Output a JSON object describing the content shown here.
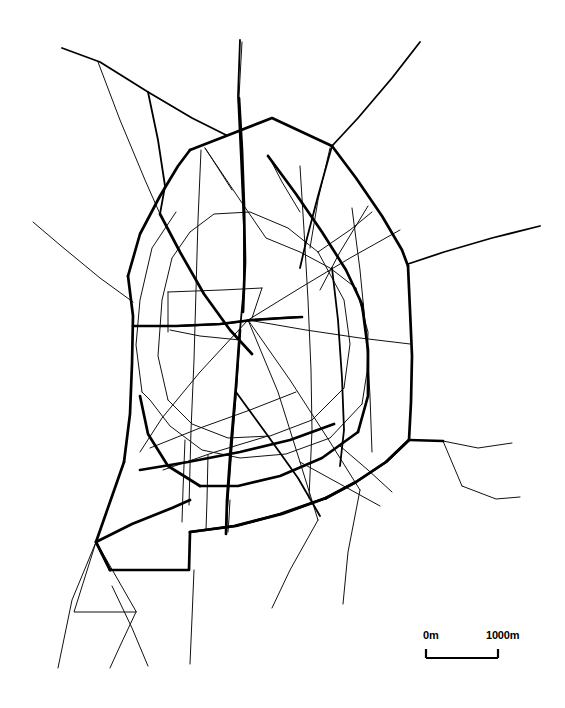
{
  "figure": {
    "kind": "schematic-road-network-map",
    "background_color": "#ffffff",
    "line_color": "#000000",
    "width": 565,
    "height": 708
  },
  "scalebar": {
    "name": "map-scale-bar",
    "left_label": "0m",
    "right_label": "1000m",
    "bar_length_px": 72,
    "represents_meters": 1000,
    "tick_color": "#000000"
  },
  "legend_notes": {
    "thick_lines": "arterial / ring roads",
    "thin_lines": "secondary streets"
  },
  "map_data": {
    "stroke_widths": {
      "arterial": 2.6,
      "major": 1.9,
      "minor": 1.0
    },
    "ring_road": {
      "name": "outer-ring-road",
      "width_class": "arterial",
      "points": [
        [
          222,
          97
        ],
        [
          330,
          145
        ],
        [
          370,
          205
        ],
        [
          405,
          265
        ],
        [
          412,
          345
        ],
        [
          410,
          432
        ],
        [
          408,
          442
        ],
        [
          330,
          497
        ],
        [
          320,
          530
        ],
        [
          188,
          532
        ],
        [
          188,
          569
        ],
        [
          108,
          569
        ],
        [
          95,
          540
        ],
        [
          128,
          470
        ],
        [
          133,
          380
        ],
        [
          127,
          300
        ],
        [
          160,
          213
        ],
        [
          190,
          150
        ]
      ]
    },
    "inner_ring": {
      "name": "inner-ring-road",
      "width_class": "major",
      "points": [
        [
          203,
          146
        ],
        [
          267,
          240
        ],
        [
          302,
          253
        ],
        [
          355,
          285
        ],
        [
          370,
          330
        ],
        [
          366,
          400
        ],
        [
          330,
          440
        ],
        [
          268,
          460
        ],
        [
          205,
          452
        ],
        [
          158,
          406
        ],
        [
          142,
          330
        ],
        [
          150,
          250
        ],
        [
          176,
          212
        ]
      ]
    },
    "radials": [
      {
        "name": "radial-nw",
        "width_class": "major",
        "points": [
          [
            190,
            150
          ],
          [
            100,
            60
          ],
          [
            62,
            47
          ]
        ]
      },
      {
        "name": "radial-n-upper",
        "width_class": "major",
        "points": [
          [
            222,
            97
          ],
          [
            240,
            40
          ]
        ]
      },
      {
        "name": "radial-ne",
        "width_class": "major",
        "points": [
          [
            330,
            145
          ],
          [
            420,
            42
          ]
        ]
      },
      {
        "name": "radial-e",
        "width_class": "major",
        "points": [
          [
            405,
            265
          ],
          [
            540,
            225
          ]
        ]
      },
      {
        "name": "radial-w",
        "width_class": "minor",
        "points": [
          [
            127,
            300
          ],
          [
            35,
            200
          ]
        ]
      },
      {
        "name": "radial-se-a",
        "width_class": "minor",
        "points": [
          [
            440,
            440
          ],
          [
            480,
            448
          ],
          [
            510,
            442
          ]
        ]
      },
      {
        "name": "radial-se-b",
        "width_class": "minor",
        "points": [
          [
            463,
            487
          ],
          [
            500,
            500
          ],
          [
            520,
            498
          ]
        ]
      },
      {
        "name": "radial-s-a",
        "width_class": "minor",
        "points": [
          [
            383,
            486
          ],
          [
            355,
            565
          ],
          [
            345,
            605
          ]
        ]
      },
      {
        "name": "radial-s-b",
        "width_class": "minor",
        "points": [
          [
            290,
            530
          ],
          [
            250,
            600
          ],
          [
            230,
            640
          ]
        ]
      },
      {
        "name": "radial-s-c",
        "width_class": "minor",
        "points": [
          [
            193,
            545
          ],
          [
            192,
            610
          ],
          [
            190,
            665
          ]
        ]
      },
      {
        "name": "radial-sw-a",
        "width_class": "minor",
        "points": [
          [
            108,
            569
          ],
          [
            70,
            640
          ],
          [
            58,
            668
          ]
        ]
      },
      {
        "name": "radial-sw-b",
        "width_class": "minor",
        "points": [
          [
            128,
            570
          ],
          [
            140,
            640
          ],
          [
            147,
            668
          ]
        ]
      },
      {
        "name": "radial-nw-branch",
        "width_class": "minor",
        "points": [
          [
            100,
            60
          ],
          [
            160,
            213
          ]
        ]
      }
    ],
    "cross_streets": [
      {
        "name": "street-center-spine",
        "width_class": "major",
        "points": [
          [
            240,
            40
          ],
          [
            238,
            120
          ],
          [
            243,
            215
          ],
          [
            240,
            300
          ],
          [
            232,
            380
          ],
          [
            228,
            470
          ],
          [
            225,
            540
          ]
        ]
      },
      {
        "name": "street-vertical-west",
        "width_class": "minor",
        "points": [
          [
            200,
            150
          ],
          [
            197,
            240
          ],
          [
            193,
            330
          ],
          [
            190,
            420
          ],
          [
            188,
            520
          ]
        ]
      },
      {
        "name": "street-vertical-east",
        "width_class": "minor",
        "points": [
          [
            300,
            165
          ],
          [
            305,
            250
          ],
          [
            310,
            330
          ],
          [
            312,
            420
          ],
          [
            308,
            500
          ]
        ]
      },
      {
        "name": "street-diagonal-a",
        "width_class": "minor",
        "points": [
          [
            150,
            250
          ],
          [
            230,
            300
          ],
          [
            300,
            340
          ],
          [
            370,
            390
          ]
        ]
      },
      {
        "name": "street-diagonal-b",
        "width_class": "minor",
        "points": [
          [
            140,
            440
          ],
          [
            220,
            400
          ],
          [
            300,
            360
          ],
          [
            380,
            320
          ]
        ]
      },
      {
        "name": "street-horizontal-mid",
        "width_class": "major",
        "points": [
          [
            133,
            325
          ],
          [
            195,
            323
          ],
          [
            260,
            318
          ],
          [
            330,
            310
          ]
        ]
      },
      {
        "name": "street-central-block-top",
        "width_class": "minor",
        "points": [
          [
            168,
            290
          ],
          [
            250,
            288
          ]
        ]
      },
      {
        "name": "street-central-block-right",
        "width_class": "minor",
        "points": [
          [
            250,
            288
          ],
          [
            245,
            320
          ]
        ]
      },
      {
        "name": "street-central-block-bottom",
        "width_class": "major",
        "points": [
          [
            245,
            320
          ],
          [
            290,
            318
          ]
        ]
      },
      {
        "name": "street-central-block-left",
        "width_class": "minor",
        "points": [
          [
            168,
            290
          ],
          [
            168,
            330
          ]
        ]
      },
      {
        "name": "street-radial-center-1",
        "width_class": "minor",
        "points": [
          [
            245,
            320
          ],
          [
            300,
            400
          ],
          [
            345,
            470
          ]
        ]
      },
      {
        "name": "street-radial-center-2",
        "width_class": "minor",
        "points": [
          [
            245,
            320
          ],
          [
            290,
            420
          ],
          [
            320,
            510
          ]
        ]
      },
      {
        "name": "street-radial-center-3",
        "width_class": "minor",
        "points": [
          [
            245,
            320
          ],
          [
            190,
            400
          ],
          [
            155,
            470
          ]
        ]
      }
    ],
    "bottom_left_loop": {
      "name": "triangular-loop-southwest",
      "width_class": "minor",
      "points": [
        [
          95,
          540
        ],
        [
          75,
          612
        ],
        [
          135,
          612
        ],
        [
          95,
          540
        ]
      ]
    },
    "bottom_right_loop": {
      "name": "small-loop-southeast",
      "width_class": "minor",
      "points": [
        [
          408,
          442
        ],
        [
          440,
          440
        ],
        [
          463,
          487
        ],
        [
          430,
          470
        ]
      ]
    }
  }
}
